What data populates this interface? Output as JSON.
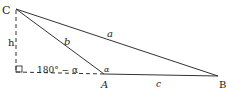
{
  "diagram": {
    "type": "triangle-altitude",
    "vertices": {
      "C": {
        "label": "C",
        "x": 16,
        "y": 9
      },
      "A": {
        "label": "A",
        "x": 104,
        "y": 74
      },
      "B": {
        "label": "B",
        "x": 218,
        "y": 76
      },
      "H": {
        "label": "",
        "x": 16,
        "y": 72
      }
    },
    "labels": {
      "C": "C",
      "A": "A",
      "B": "B",
      "h": "h",
      "a": "a",
      "b": "b",
      "c": "c",
      "supplement_angle": "180° − α",
      "alpha": "α"
    },
    "colors": {
      "stroke": "#333333",
      "background": "#ffffff"
    }
  }
}
